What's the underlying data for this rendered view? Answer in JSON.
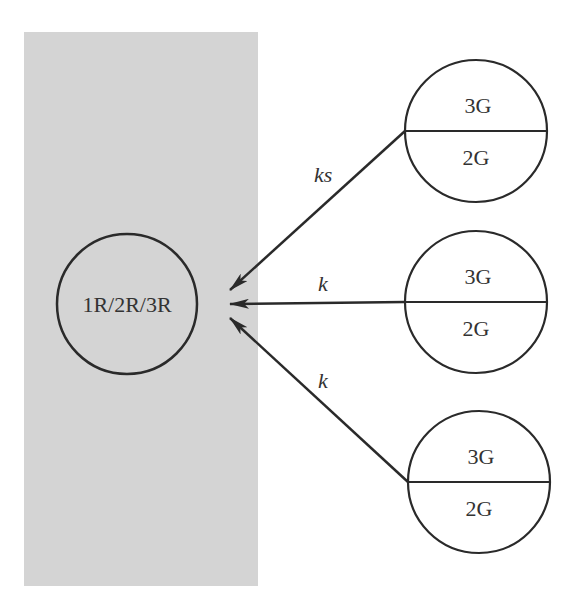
{
  "colors": {
    "background": "#ffffff",
    "panel": "#d4d4d4",
    "stroke": "#2a2a2a",
    "text": "#333333"
  },
  "panel": {
    "x": 24,
    "y": 32,
    "width": 234,
    "height": 554
  },
  "center_node": {
    "label": "1R/2R/3R",
    "cx": 127,
    "cy": 304,
    "r": 70
  },
  "source_nodes": [
    {
      "top_label": "3G",
      "bottom_label": "2G",
      "cx": 476,
      "cy": 131,
      "r": 71
    },
    {
      "top_label": "3G",
      "bottom_label": "2G",
      "cx": 476,
      "cy": 302,
      "r": 71
    },
    {
      "top_label": "3G",
      "bottom_label": "2G",
      "cx": 479,
      "cy": 482,
      "r": 71
    }
  ],
  "edges": [
    {
      "label": "ks",
      "from": 0,
      "x1": 405,
      "y1": 131,
      "x2": 230,
      "y2": 290,
      "label_x": 314,
      "label_y": 182
    },
    {
      "label": "k",
      "from": 1,
      "x1": 405,
      "y1": 302,
      "x2": 230,
      "y2": 304,
      "label_x": 318,
      "label_y": 291
    },
    {
      "label": "k",
      "from": 2,
      "x1": 408,
      "y1": 482,
      "x2": 230,
      "y2": 318,
      "label_x": 318,
      "label_y": 388
    }
  ]
}
